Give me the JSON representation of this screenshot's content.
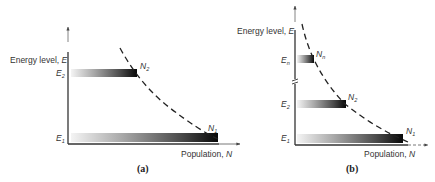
{
  "panels": [
    {
      "id": "a",
      "caption": "(a)",
      "y_axis_label": "Energy level, ",
      "y_axis_symbol": "E",
      "x_axis_label": "Population, ",
      "x_axis_symbol": "N",
      "levels": [
        {
          "label": "E",
          "sub": "2",
          "pop_label": "N",
          "pop_sub": "2"
        },
        {
          "label": "E",
          "sub": "1",
          "pop_label": "N",
          "pop_sub": "1"
        }
      ]
    },
    {
      "id": "b",
      "caption": "(b)",
      "y_axis_label": "Energy level, ",
      "y_axis_symbol": "E",
      "x_axis_label": "Population, ",
      "x_axis_symbol": "N",
      "levels": [
        {
          "label": "E",
          "sub": "n",
          "pop_label": "N",
          "pop_sub": "n"
        },
        {
          "label": "E",
          "sub": "2",
          "pop_label": "N",
          "pop_sub": "2"
        },
        {
          "label": "E",
          "sub": "1",
          "pop_label": "N",
          "pop_sub": "1"
        }
      ]
    }
  ],
  "colors": {
    "axis": "#333333",
    "bar_dark": "#0a0a0a",
    "bar_light": "#f2f2f2",
    "curve": "#222222"
  }
}
